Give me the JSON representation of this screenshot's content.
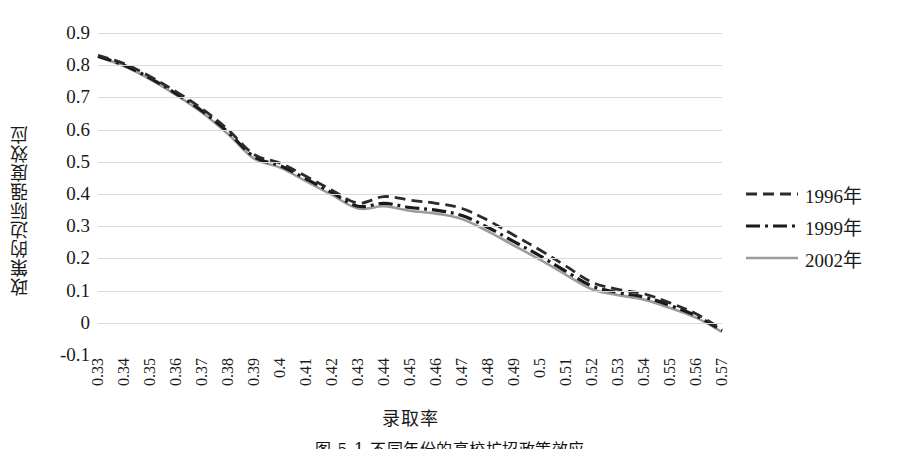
{
  "chart_data": {
    "type": "line",
    "title": "",
    "xlabel": "录取率",
    "ylabel": "政策的边际强度效应",
    "grid": true,
    "legend_position": "right",
    "xlim": [
      0.33,
      0.57
    ],
    "ylim": [
      -0.1,
      0.9
    ],
    "ytick_labels": [
      "0.9",
      "0.8",
      "0.7",
      "0.6",
      "0.5",
      "0.4",
      "0.3",
      "0.2",
      "0.1",
      "0",
      "-0.1"
    ],
    "ytick_values": [
      0.9,
      0.8,
      0.7,
      0.6,
      0.5,
      0.4,
      0.3,
      0.2,
      0.1,
      0,
      -0.1
    ],
    "categories": [
      "0.33",
      "0.34",
      "0.35",
      "0.36",
      "0.37",
      "0.38",
      "0.39",
      "0.4",
      "0.41",
      "0.42",
      "0.43",
      "0.44",
      "0.45",
      "0.46",
      "0.47",
      "0.48",
      "0.49",
      "0.5",
      "0.51",
      "0.52",
      "0.53",
      "0.54",
      "0.55",
      "0.56",
      "0.57"
    ],
    "x": [
      0.33,
      0.34,
      0.35,
      0.36,
      0.37,
      0.38,
      0.39,
      0.4,
      0.41,
      0.42,
      0.43,
      0.44,
      0.45,
      0.46,
      0.47,
      0.48,
      0.49,
      0.5,
      0.51,
      0.52,
      0.53,
      0.54,
      0.55,
      0.56,
      0.57
    ],
    "series": [
      {
        "name": "1996年",
        "style": "dashed",
        "color": "#2b2b2b",
        "values": [
          0.831,
          0.805,
          0.765,
          0.718,
          0.665,
          0.6,
          0.523,
          0.496,
          0.455,
          0.412,
          0.372,
          0.392,
          0.381,
          0.371,
          0.355,
          0.318,
          0.272,
          0.226,
          0.176,
          0.126,
          0.104,
          0.09,
          0.062,
          0.028,
          -0.02
        ]
      },
      {
        "name": "1999年",
        "style": "dash-dot",
        "color": "#1a1a1a",
        "values": [
          0.828,
          0.8,
          0.76,
          0.712,
          0.658,
          0.592,
          0.516,
          0.488,
          0.447,
          0.404,
          0.362,
          0.371,
          0.358,
          0.35,
          0.333,
          0.296,
          0.252,
          0.208,
          0.16,
          0.114,
          0.094,
          0.08,
          0.054,
          0.022,
          -0.024
        ]
      },
      {
        "name": "2002年",
        "style": "solid",
        "color": "#9c9c9c",
        "values": [
          0.826,
          0.797,
          0.756,
          0.708,
          0.653,
          0.586,
          0.51,
          0.482,
          0.44,
          0.397,
          0.355,
          0.362,
          0.348,
          0.339,
          0.322,
          0.284,
          0.24,
          0.196,
          0.149,
          0.104,
          0.086,
          0.072,
          0.046,
          0.016,
          -0.028
        ]
      }
    ]
  },
  "legend": {
    "items": [
      {
        "label": "1996年",
        "style": "dashed",
        "color": "#2b2b2b"
      },
      {
        "label": "1999年",
        "style": "dash-dot",
        "color": "#1a1a1a"
      },
      {
        "label": "2002年",
        "style": "solid",
        "color": "#9c9c9c"
      }
    ]
  },
  "caption": "图 5-1  不同年份的高校扩招政策效应"
}
